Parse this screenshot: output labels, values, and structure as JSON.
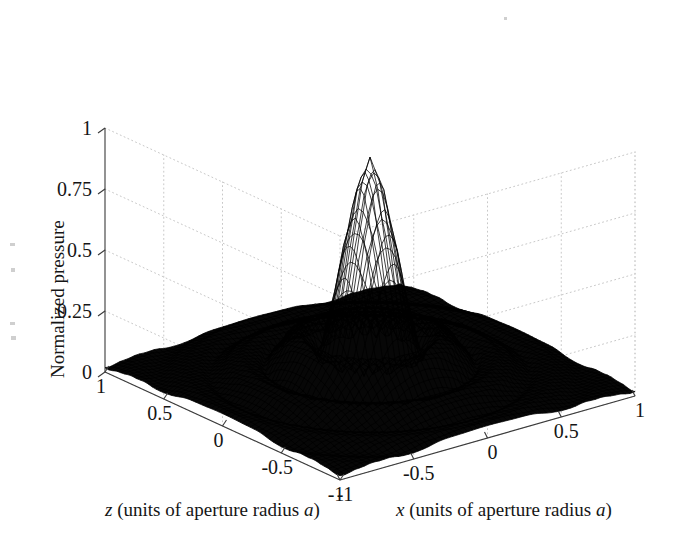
{
  "figure": {
    "background": "#ffffff",
    "ink": "#111111",
    "grid_color": "#c8c8c8",
    "surface_color": "#000000",
    "type": "3d-mesh-surface"
  },
  "axes": {
    "vertical": {
      "title": "Normalized pressure",
      "ticks": [
        "1",
        "0.75",
        "0.5",
        "0.25",
        "0"
      ],
      "values": [
        1,
        0.75,
        0.5,
        0.25,
        0
      ]
    },
    "depth": {
      "title_parts": {
        "var": "z",
        "mid": " (units of aperture radius ",
        "unit": "a",
        "close": ")"
      },
      "title": "z (units of aperture radius a)",
      "ticks": [
        "1",
        "0.5",
        "0",
        "-0.5",
        "-1"
      ],
      "values": [
        1,
        0.5,
        0,
        -0.5,
        -1
      ]
    },
    "horizontal": {
      "title_parts": {
        "var": "x",
        "mid": " (units of aperture radius ",
        "unit": "a",
        "close": ")"
      },
      "title": "x (units of aperture radius a)",
      "ticks": [
        "-1",
        "-0.5",
        "0",
        "0.5",
        "1"
      ],
      "values": [
        -1,
        -0.5,
        0,
        0.5,
        1
      ]
    }
  },
  "chart_data": {
    "type": "surface",
    "title": "",
    "xlabel": "x (units of aperture radius a)",
    "ylabel": "z (units of aperture radius a)",
    "zlabel": "Normalized pressure",
    "xlim": [
      -1,
      1
    ],
    "ylim": [
      -1,
      1
    ],
    "zlim": [
      0,
      1
    ],
    "xticks": [
      -1,
      -0.5,
      0,
      0.5,
      1
    ],
    "yticks": [
      1,
      0.5,
      0,
      -0.5,
      -1
    ],
    "zticks": [
      0,
      0.25,
      0.5,
      0.75,
      1
    ],
    "grid": true,
    "legend": "none",
    "peak": {
      "x": 0.0,
      "z": 0.0,
      "value": 0.93
    },
    "mesh_n": 61,
    "ripple_amplitudes": [
      0.93,
      0.14,
      0.07,
      0.045,
      0.03,
      0.022
    ],
    "ripple_radii": [
      0.0,
      0.17,
      0.31,
      0.45,
      0.6,
      0.75
    ]
  },
  "geometry": {
    "origin": {
      "x": 105,
      "y": 372
    },
    "top": {
      "x": 105,
      "y": 128
    },
    "front": {
      "x": 340,
      "y": 480
    },
    "right": {
      "x": 635,
      "y": 396
    },
    "back": {
      "x": 408,
      "y": 290
    },
    "back_top": {
      "x": 408,
      "y": 46
    }
  }
}
